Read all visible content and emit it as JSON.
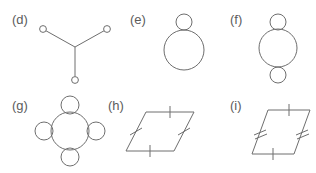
{
  "page": {
    "background_color": "#ffffff",
    "stroke_color": "#6e6e6e",
    "label_color": "#5c5c5c",
    "width": 316,
    "height": 173
  },
  "figures": [
    {
      "id": "d",
      "label": "(d)",
      "type": "graph",
      "description": "Y-shaped graph: three edges meeting at a central junction, each ending in a small open circle",
      "center_vertex": {
        "x": 75,
        "y": 45
      },
      "nodes": [
        {
          "name": "node-upper-left",
          "x": 43,
          "y": 27,
          "r": 3.5
        },
        {
          "name": "node-upper-right",
          "x": 107,
          "y": 27,
          "r": 3.5
        },
        {
          "name": "node-bottom",
          "x": 75,
          "y": 78,
          "r": 3.5
        }
      ],
      "edges": [
        {
          "from": "center",
          "to": "node-upper-left"
        },
        {
          "from": "center",
          "to": "node-upper-right"
        },
        {
          "from": "center",
          "to": "node-bottom"
        }
      ]
    },
    {
      "id": "e",
      "label": "(e)",
      "type": "circles",
      "description": "Large circle with one small circle tangent at the top",
      "circles": [
        {
          "name": "small-circle-top",
          "cx": 56,
          "cy": 20,
          "r": 8
        },
        {
          "name": "large-circle",
          "cx": 56,
          "cy": 48,
          "r": 20
        }
      ]
    },
    {
      "id": "f",
      "label": "(f)",
      "type": "circles",
      "description": "Large circle with small circles tangent at top and bottom",
      "circles": [
        {
          "name": "small-circle-top",
          "cx": 50,
          "cy": 20,
          "r": 8
        },
        {
          "name": "large-circle",
          "cx": 50,
          "cy": 46,
          "r": 19
        },
        {
          "name": "small-circle-bottom",
          "cx": 50,
          "cy": 73,
          "r": 8
        }
      ]
    },
    {
      "id": "g",
      "label": "(g)",
      "type": "circles",
      "description": "Central circle with four small circles tangent at north, east, south and west",
      "circles": [
        {
          "name": "center-circle",
          "cx": 70,
          "cy": 43,
          "r": 19
        },
        {
          "name": "small-circle-north",
          "cx": 70,
          "cy": 17,
          "r": 9
        },
        {
          "name": "small-circle-east",
          "cx": 96,
          "cy": 43,
          "r": 9
        },
        {
          "name": "small-circle-south",
          "cx": 70,
          "cy": 69,
          "r": 9
        },
        {
          "name": "small-circle-west",
          "cx": 44,
          "cy": 43,
          "r": 9
        }
      ]
    },
    {
      "id": "h",
      "label": "(h)",
      "type": "parallelogram",
      "description": "Parallelogram (rhombus) with a single tick mark on all four sides, indicating all sides congruent",
      "vertices": [
        {
          "name": "top-left",
          "x": 42,
          "y": 24
        },
        {
          "name": "top-right",
          "x": 90,
          "y": 24
        },
        {
          "name": "bottom-right",
          "x": 70,
          "y": 63
        },
        {
          "name": "bottom-left",
          "x": 22,
          "y": 63
        }
      ],
      "tick_marks": [
        {
          "side": "top",
          "count": 1
        },
        {
          "side": "right",
          "count": 1
        },
        {
          "side": "bottom",
          "count": 1
        },
        {
          "side": "left",
          "count": 1
        }
      ]
    },
    {
      "id": "i",
      "label": "(i)",
      "type": "parallelogram",
      "description": "Parallelogram with single tick marks on the horizontal sides and double tick marks on the slanted sides",
      "vertices": [
        {
          "name": "top-left",
          "x": 40,
          "y": 22
        },
        {
          "name": "top-right",
          "x": 82,
          "y": 22
        },
        {
          "name": "bottom-right",
          "x": 66,
          "y": 66
        },
        {
          "name": "bottom-left",
          "x": 24,
          "y": 66
        }
      ],
      "tick_marks": [
        {
          "side": "top",
          "count": 1
        },
        {
          "side": "right",
          "count": 2
        },
        {
          "side": "bottom",
          "count": 1
        },
        {
          "side": "left",
          "count": 2
        }
      ]
    }
  ]
}
